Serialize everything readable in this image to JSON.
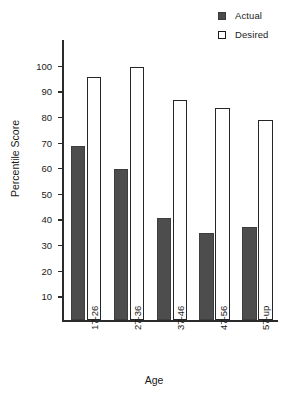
{
  "chart_data": {
    "type": "bar",
    "title": "",
    "xlabel": "Age",
    "ylabel": "Percentile Score",
    "categories": [
      "17-26",
      "27-36",
      "37-46",
      "47-56",
      "57-up"
    ],
    "series": [
      {
        "name": "Actual",
        "values": [
          68,
          59,
          40,
          34,
          36.5
        ],
        "color": "#4d4d4d",
        "style": "filled"
      },
      {
        "name": "Desired",
        "values": [
          95,
          99,
          86,
          83,
          78
        ],
        "color": "#ffffff",
        "style": "outlined"
      }
    ],
    "yticks": [
      10,
      20,
      30,
      40,
      50,
      60,
      70,
      80,
      90,
      100
    ],
    "ylim": [
      0,
      110
    ],
    "grid": false,
    "legend_position": "top-right",
    "legend_entries": [
      "Actual",
      "Desired"
    ],
    "xtick_rotation": -90
  },
  "caption": ""
}
